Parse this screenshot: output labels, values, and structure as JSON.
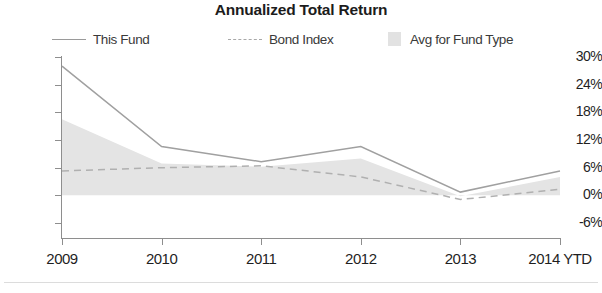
{
  "chart": {
    "title": "Annualized Total Return",
    "legend": [
      {
        "label": "This Fund",
        "key": "solid-line",
        "color": "#9a9a9a"
      },
      {
        "label": "Bond Index",
        "key": "dashed-line",
        "color": "#a8a8a8"
      },
      {
        "label": "Avg for Fund Type",
        "key": "filled-square",
        "color": "#e2e2e2"
      }
    ],
    "ylabels": [
      "30%",
      "24%",
      "18%",
      "12%",
      "6%",
      "0%",
      "-6%"
    ],
    "xlabels": [
      "2009",
      "2010",
      "2011",
      "2012",
      "2013",
      "2014 YTD"
    ]
  },
  "chart_data": {
    "type": "line",
    "title": "Annualized Total Return",
    "xlabel": "",
    "ylabel": "",
    "categories": [
      "2009",
      "2010",
      "2011",
      "2012",
      "2013",
      "2014 YTD"
    ],
    "ylim": [
      -6,
      30
    ],
    "yticks": [
      30,
      24,
      18,
      12,
      6,
      0,
      -6
    ],
    "ytick_labels": [
      "30%",
      "24%",
      "18%",
      "12%",
      "6%",
      "0%",
      "-6%"
    ],
    "grid": false,
    "legend_position": "top",
    "series": [
      {
        "name": "This Fund",
        "style": "solid",
        "color": "#9a9a9a",
        "values": [
          28.0,
          10.6,
          7.3,
          10.6,
          0.7,
          5.3
        ]
      },
      {
        "name": "Bond Index",
        "style": "dashed",
        "color": "#a8a8a8",
        "values": [
          5.3,
          6.0,
          6.4,
          4.0,
          -0.9,
          1.3
        ]
      },
      {
        "name": "Avg for Fund Type",
        "style": "area",
        "color": "#e2e2e2",
        "baseline": 0,
        "values": [
          16.5,
          6.9,
          6.2,
          8.0,
          -0.2,
          4.0
        ]
      }
    ]
  }
}
